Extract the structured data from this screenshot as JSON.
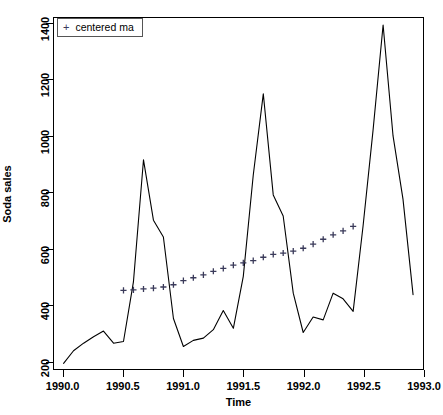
{
  "chart_data": {
    "type": "line",
    "title": "",
    "xlabel": "Time",
    "ylabel": "Soda sales",
    "xlim": [
      1989.92,
      1993.0
    ],
    "ylim": [
      170,
      1420
    ],
    "xticks": [
      1990.0,
      1990.5,
      1991.0,
      1991.5,
      1992.0,
      1992.5,
      1993.0
    ],
    "xticklabels": [
      "1990.0",
      "1990.5",
      "1991.0",
      "1991.5",
      "1992.0",
      "1992.5",
      "1993.0"
    ],
    "yticks": [
      200,
      400,
      600,
      800,
      1000,
      1200,
      1400
    ],
    "yticklabels": [
      "200",
      "400",
      "600",
      "800",
      "1000",
      "1200",
      "1400"
    ],
    "grid": false,
    "legend": {
      "position": "top-left",
      "entries": [
        {
          "label": "centered ma",
          "marker": "+",
          "color": "#3a3a5a"
        }
      ]
    },
    "series": [
      {
        "name": "Soda sales",
        "type": "line",
        "color": "#000000",
        "x": [
          1990.0,
          1990.083,
          1990.167,
          1990.25,
          1990.333,
          1990.417,
          1990.5,
          1990.583,
          1990.667,
          1990.75,
          1990.833,
          1990.917,
          1991.0,
          1991.083,
          1991.167,
          1991.25,
          1991.333,
          1991.417,
          1991.5,
          1991.583,
          1991.667,
          1991.75,
          1991.833,
          1991.917,
          1992.0,
          1992.083,
          1992.167,
          1992.25,
          1992.333,
          1992.417,
          1992.5,
          1992.583,
          1992.667,
          1992.75,
          1992.833,
          1992.917
        ],
        "y": [
          190,
          235,
          262,
          285,
          305,
          262,
          268,
          480,
          915,
          700,
          640,
          350,
          250,
          272,
          280,
          310,
          378,
          315,
          500,
          860,
          1150,
          790,
          715,
          440,
          300,
          355,
          345,
          440,
          420,
          375,
          680,
          1020,
          1395,
          1000,
          775,
          435
        ]
      },
      {
        "name": "centered ma",
        "type": "scatter",
        "marker": "+",
        "color": "#3a3a5a",
        "x": [
          1990.5,
          1990.583,
          1990.667,
          1990.75,
          1990.833,
          1990.917,
          1991.0,
          1991.083,
          1991.167,
          1991.25,
          1991.333,
          1991.417,
          1991.5,
          1991.583,
          1991.667,
          1991.75,
          1991.833,
          1991.917,
          1992.0,
          1992.083,
          1992.167,
          1992.25,
          1992.333,
          1992.417
        ],
        "y": [
          450,
          452,
          455,
          458,
          462,
          470,
          485,
          495,
          505,
          518,
          528,
          540,
          548,
          556,
          568,
          578,
          583,
          590,
          600,
          615,
          632,
          648,
          662,
          678
        ]
      }
    ]
  }
}
